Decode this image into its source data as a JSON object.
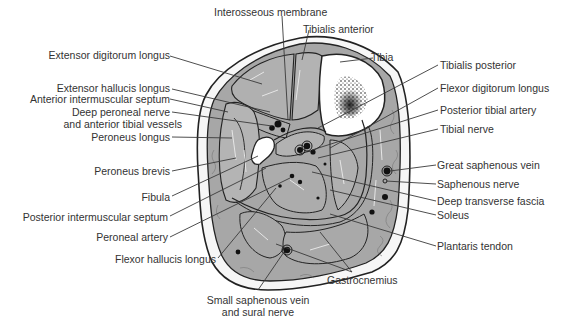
{
  "diagram": {
    "labels_top": [
      {
        "id": "interosseous-membrane",
        "text": "Interosseous membrane"
      },
      {
        "id": "tibialis-anterior",
        "text": "Tibialis anterior"
      },
      {
        "id": "tibia",
        "text": "Tibia"
      }
    ],
    "labels_left": [
      {
        "id": "extensor-digitorum-longus",
        "text": "Extensor digitorum longus"
      },
      {
        "id": "extensor-hallucis-longus",
        "text": "Extensor hallucis longus"
      },
      {
        "id": "anterior-intermuscular-septum",
        "text": "Anterior intermuscular septum"
      },
      {
        "id": "deep-peroneal-nerve",
        "text": "Deep peroneal nerve"
      },
      {
        "id": "anterior-tibial-vessels",
        "text": "and anterior tibial vessels"
      },
      {
        "id": "peroneus-longus",
        "text": "Peroneus longus"
      },
      {
        "id": "peroneus-brevis",
        "text": "Peroneus brevis"
      },
      {
        "id": "fibula",
        "text": "Fibula"
      },
      {
        "id": "posterior-intermuscular-septum",
        "text": "Posterior intermuscular septum"
      },
      {
        "id": "peroneal-artery",
        "text": "Peroneal artery"
      },
      {
        "id": "flexor-hallucis-longus",
        "text": "Flexor hallucis longus"
      }
    ],
    "labels_right": [
      {
        "id": "tibialis-posterior",
        "text": "Tibialis posterior"
      },
      {
        "id": "flexor-digitorum-longus",
        "text": "Flexor digitorum longus"
      },
      {
        "id": "posterior-tibial-artery",
        "text": "Posterior tibial artery"
      },
      {
        "id": "tibial-nerve",
        "text": "Tibial nerve"
      },
      {
        "id": "great-saphenous-vein",
        "text": "Great saphenous vein"
      },
      {
        "id": "saphenous-nerve",
        "text": "Saphenous nerve"
      },
      {
        "id": "deep-transverse-fascia",
        "text": "Deep transverse fascia"
      },
      {
        "id": "soleus",
        "text": "Soleus"
      },
      {
        "id": "plantaris-tendon",
        "text": "Plantaris tendon"
      }
    ],
    "labels_bottom": [
      {
        "id": "gastrocnemius",
        "text": "Gastrocnemius"
      },
      {
        "id": "small-saphenous-vein",
        "text": "Small saphenous vein"
      },
      {
        "id": "sural-nerve",
        "text": "and sural nerve"
      }
    ],
    "colors": {
      "muscle": "#a9a9a9",
      "muscle_light": "#bdbdbd",
      "outline": "#2b2b2b",
      "bone": "#ffffff",
      "fat": "#f4f4f4",
      "leader": "#444444"
    }
  }
}
